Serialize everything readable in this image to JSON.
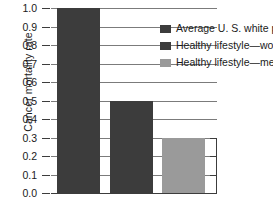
{
  "chart_data": {
    "type": "bar",
    "title": "",
    "xlabel": "",
    "ylabel": "Cancer mortality rate",
    "ylim": [
      0.0,
      1.0
    ],
    "grid": true,
    "legend_position": "top-right-inside",
    "categories": [
      "Average U. S. white population",
      "Healthy lifestyle—women",
      "Healthy lifestyle—men"
    ],
    "values": [
      1.0,
      0.5,
      0.3
    ],
    "bar_colors": [
      "#3c3c3c",
      "#3c3c3c",
      "#9a9a9a"
    ],
    "ytick_labels": [
      "1.0",
      "0.9",
      "0.8",
      "0.7",
      "0.6",
      "0.5",
      "0.4",
      "0.3",
      "0.2",
      "0.1",
      "0.0"
    ],
    "ytick_values": [
      1.0,
      0.9,
      0.8,
      0.7,
      0.6,
      0.5,
      0.4,
      0.3,
      0.2,
      0.1,
      0.0
    ],
    "series": [
      {
        "name": "Average U. S. white population",
        "value": 1.0,
        "color": "#3c3c3c"
      },
      {
        "name": "Healthy lifestyle—women",
        "value": 0.5,
        "color": "#3c3c3c"
      },
      {
        "name": "Healthy lifestyle—men",
        "value": 0.3,
        "color": "#9a9a9a"
      }
    ]
  },
  "axis": {
    "y_title": "Cancer mortality rate",
    "ticks": [
      {
        "label": "1.0",
        "value": 1.0
      },
      {
        "label": "0.9",
        "value": 0.9
      },
      {
        "label": "0.8",
        "value": 0.8
      },
      {
        "label": "0.7",
        "value": 0.7
      },
      {
        "label": "0.6",
        "value": 0.6
      },
      {
        "label": "0.5",
        "value": 0.5
      },
      {
        "label": "0.4",
        "value": 0.4
      },
      {
        "label": "0.3",
        "value": 0.3
      },
      {
        "label": "0.2",
        "value": 0.2
      },
      {
        "label": "0.1",
        "value": 0.1
      },
      {
        "label": "0.0",
        "value": 0.0
      }
    ]
  },
  "legend": {
    "items": [
      {
        "label": "Average U. S. white population",
        "color": "#3c3c3c"
      },
      {
        "label": "Healthy lifestyle—women",
        "color": "#3c3c3c"
      },
      {
        "label": "Healthy lifestyle—men",
        "color": "#9a9a9a"
      }
    ]
  }
}
